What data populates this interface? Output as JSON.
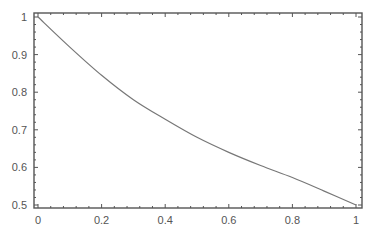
{
  "chart_data": {
    "type": "line",
    "title": "",
    "xlabel": "",
    "ylabel": "",
    "xlim": [
      0,
      1
    ],
    "ylim": [
      0.5,
      1
    ],
    "grid": false,
    "legend": null,
    "x_ticks": [
      0,
      0.2,
      0.4,
      0.6,
      0.8,
      1
    ],
    "x_tick_labels": [
      "0",
      "0.2",
      "0.4",
      "0.6",
      "0.8",
      "1"
    ],
    "y_ticks": [
      0.5,
      0.6,
      0.7,
      0.8,
      0.9,
      1
    ],
    "y_tick_labels": [
      "0.5",
      "0.6",
      "0.7",
      "0.8",
      "0.9",
      "1"
    ],
    "series": [
      {
        "name": "curve",
        "color": "#777777",
        "x": [
          0,
          0.1,
          0.2,
          0.3,
          0.4,
          0.5,
          0.6,
          0.7,
          0.8,
          0.9,
          1.0
        ],
        "y": [
          1.0,
          0.92,
          0.845,
          0.78,
          0.728,
          0.68,
          0.64,
          0.605,
          0.573,
          0.537,
          0.5
        ]
      }
    ]
  },
  "style": {
    "frame_color": "#555555",
    "curve_color": "#777777",
    "label_color": "#555555"
  }
}
